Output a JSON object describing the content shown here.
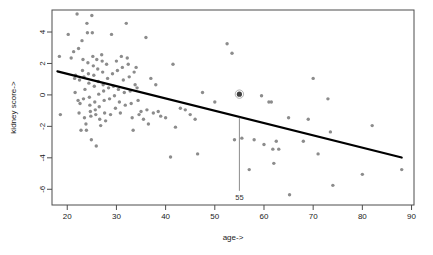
{
  "chart_data": {
    "type": "scatter",
    "title": "",
    "xlabel": "age->",
    "ylabel": "kidney score->",
    "xlim": [
      16.9,
      90.5
    ],
    "ylim": [
      -7.0,
      5.4
    ],
    "grid": false,
    "legend": "none",
    "xticks": [
      20,
      30,
      40,
      50,
      60,
      70,
      80,
      90
    ],
    "yticks": [
      4,
      2,
      0,
      -2,
      -4,
      -6
    ],
    "point_color": "#8c8c8c",
    "line_color": "#000000",
    "marker_color": "#8c8c8c",
    "annotation": {
      "label": "55",
      "x": 55,
      "y_top": -1.45,
      "y_bottom": -6.1,
      "highlight_point": {
        "x": 55,
        "y": 0.05,
        "style": "asterisk"
      }
    },
    "regression": {
      "x0": 18.0,
      "y0": 1.5,
      "x1": 88.0,
      "y1": -3.98
    },
    "points": [
      [
        18.4,
        2.45
      ],
      [
        18.6,
        -1.25
      ],
      [
        20.2,
        3.85
      ],
      [
        20.8,
        2.35
      ],
      [
        21.3,
        2.75
      ],
      [
        21.5,
        1.05
      ],
      [
        21.6,
        0.15
      ],
      [
        21.7,
        1.25
      ],
      [
        22.0,
        5.15
      ],
      [
        22.2,
        -0.35
      ],
      [
        22.3,
        2.95
      ],
      [
        22.4,
        -1.15
      ],
      [
        22.5,
        0.95
      ],
      [
        22.6,
        -0.55
      ],
      [
        22.8,
        -2.25
      ],
      [
        23.0,
        3.45
      ],
      [
        23.1,
        1.55
      ],
      [
        23.2,
        2.25
      ],
      [
        23.3,
        -0.25
      ],
      [
        23.4,
        1.15
      ],
      [
        23.5,
        -1.45
      ],
      [
        23.6,
        0.35
      ],
      [
        23.8,
        -1.85
      ],
      [
        23.9,
        -2.25
      ],
      [
        24.0,
        4.55
      ],
      [
        24.1,
        3.95
      ],
      [
        24.2,
        2.05
      ],
      [
        24.3,
        1.35
      ],
      [
        24.4,
        0.75
      ],
      [
        24.5,
        -0.15
      ],
      [
        24.6,
        -0.65
      ],
      [
        24.7,
        -1.05
      ],
      [
        24.8,
        -1.35
      ],
      [
        24.9,
        -2.85
      ],
      [
        25.0,
        5.05
      ],
      [
        25.1,
        3.95
      ],
      [
        25.2,
        2.45
      ],
      [
        25.3,
        1.85
      ],
      [
        25.4,
        1.25
      ],
      [
        25.5,
        0.55
      ],
      [
        25.6,
        -0.45
      ],
      [
        25.7,
        -0.95
      ],
      [
        25.8,
        -1.25
      ],
      [
        25.9,
        -3.25
      ],
      [
        26.0,
        2.25
      ],
      [
        26.2,
        1.65
      ],
      [
        26.3,
        0.85
      ],
      [
        26.4,
        0.05
      ],
      [
        26.5,
        -0.75
      ],
      [
        26.6,
        -1.55
      ],
      [
        26.8,
        -1.95
      ],
      [
        27.0,
        2.55
      ],
      [
        27.1,
        2.15
      ],
      [
        27.2,
        1.45
      ],
      [
        27.3,
        0.65
      ],
      [
        27.4,
        0.25
      ],
      [
        27.5,
        -0.35
      ],
      [
        27.6,
        -1.15
      ],
      [
        27.8,
        -1.65
      ],
      [
        28.0,
        1.95
      ],
      [
        28.2,
        1.05
      ],
      [
        28.4,
        0.45
      ],
      [
        28.6,
        -0.25
      ],
      [
        28.8,
        -1.25
      ],
      [
        29.0,
        3.85
      ],
      [
        29.2,
        1.35
      ],
      [
        29.4,
        0.55
      ],
      [
        29.6,
        -0.05
      ],
      [
        29.8,
        -0.85
      ],
      [
        30.0,
        2.15
      ],
      [
        30.2,
        1.55
      ],
      [
        30.4,
        0.35
      ],
      [
        30.6,
        -0.45
      ],
      [
        30.8,
        -1.15
      ],
      [
        31.0,
        2.45
      ],
      [
        31.2,
        1.75
      ],
      [
        31.4,
        0.95
      ],
      [
        31.6,
        0.15
      ],
      [
        31.8,
        -0.65
      ],
      [
        32.0,
        4.55
      ],
      [
        32.2,
        2.35
      ],
      [
        32.4,
        1.95
      ],
      [
        32.6,
        1.15
      ],
      [
        32.8,
        0.25
      ],
      [
        33.0,
        -0.55
      ],
      [
        33.2,
        -1.45
      ],
      [
        33.4,
        -2.25
      ],
      [
        33.6,
        1.45
      ],
      [
        33.8,
        0.65
      ],
      [
        34.0,
        1.75
      ],
      [
        34.2,
        0.45
      ],
      [
        34.4,
        -0.35
      ],
      [
        34.6,
        -1.25
      ],
      [
        35.0,
        -1.05
      ],
      [
        35.5,
        -1.55
      ],
      [
        36.0,
        3.65
      ],
      [
        36.2,
        -0.95
      ],
      [
        36.5,
        -1.85
      ],
      [
        37.0,
        1.05
      ],
      [
        37.5,
        -1.15
      ],
      [
        38.0,
        0.65
      ],
      [
        38.5,
        -1.05
      ],
      [
        39.0,
        -1.35
      ],
      [
        40.0,
        -1.45
      ],
      [
        41.0,
        -3.95
      ],
      [
        41.5,
        1.95
      ],
      [
        42.0,
        -2.05
      ],
      [
        43.0,
        -0.85
      ],
      [
        44.0,
        -0.95
      ],
      [
        45.0,
        -1.25
      ],
      [
        46.0,
        -1.55
      ],
      [
        46.5,
        -3.75
      ],
      [
        47.5,
        0.15
      ],
      [
        50.0,
        -0.45
      ],
      [
        52.5,
        3.25
      ],
      [
        53.5,
        2.65
      ],
      [
        54.0,
        -2.85
      ],
      [
        55.0,
        0.05
      ],
      [
        55.5,
        -2.75
      ],
      [
        57.0,
        -4.75
      ],
      [
        58.0,
        -2.85
      ],
      [
        59.5,
        -0.05
      ],
      [
        60.0,
        -3.15
      ],
      [
        61.0,
        -0.45
      ],
      [
        61.5,
        -0.45
      ],
      [
        61.8,
        -3.45
      ],
      [
        62.0,
        -4.35
      ],
      [
        62.5,
        -2.95
      ],
      [
        63.0,
        -3.45
      ],
      [
        65.0,
        -1.45
      ],
      [
        65.2,
        -6.35
      ],
      [
        68.0,
        -2.95
      ],
      [
        69.0,
        -1.55
      ],
      [
        70.0,
        1.05
      ],
      [
        71.0,
        -3.75
      ],
      [
        73.0,
        -0.25
      ],
      [
        73.5,
        -2.35
      ],
      [
        74.0,
        -5.75
      ],
      [
        80.0,
        -5.05
      ],
      [
        82.0,
        -1.95
      ],
      [
        88.0,
        -4.75
      ]
    ]
  }
}
